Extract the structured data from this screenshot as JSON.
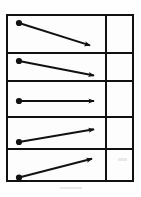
{
  "figure": {
    "background_color": "#ffffff",
    "ink_color": "#111111",
    "frame": {
      "x": 6,
      "y": 14,
      "width": 128,
      "height": 168,
      "border_width": 2
    },
    "columns": [
      {
        "name": "vector-column",
        "x": 0,
        "width": 97,
        "label": ""
      },
      {
        "name": "answer-column",
        "x": 99,
        "width": 27,
        "label": ""
      }
    ],
    "column_divider_x": 97,
    "row_divider_ys": [
      36,
      64,
      100,
      132
    ],
    "rows": [
      {
        "index": 1,
        "name": "row-1",
        "vector": {
          "name": "arrow-down-steep",
          "direction": "down-right",
          "start": {
            "x": 11,
            "y": 7
          },
          "end": {
            "x": 84,
            "y": 30
          },
          "dx": 73,
          "dy": 23,
          "slope_description": "steeply descending",
          "has_start_dot": true,
          "has_arrowhead": true
        },
        "answer_cell": ""
      },
      {
        "index": 2,
        "name": "row-2",
        "vector": {
          "name": "arrow-down-shallow",
          "direction": "down-right",
          "start": {
            "x": 11,
            "y": 7
          },
          "end": {
            "x": 88,
            "y": 22
          },
          "dx": 77,
          "dy": 15,
          "slope_description": "gently descending",
          "has_start_dot": true,
          "has_arrowhead": true
        },
        "answer_cell": ""
      },
      {
        "index": 3,
        "name": "row-3",
        "vector": {
          "name": "arrow-horizontal",
          "direction": "right",
          "start": {
            "x": 11,
            "y": 18
          },
          "end": {
            "x": 88,
            "y": 18
          },
          "dx": 77,
          "dy": 0,
          "slope_description": "horizontal",
          "has_start_dot": true,
          "has_arrowhead": true
        },
        "answer_cell": ""
      },
      {
        "index": 4,
        "name": "row-4",
        "vector": {
          "name": "arrow-up-shallow",
          "direction": "up-right",
          "start": {
            "x": 11,
            "y": 24
          },
          "end": {
            "x": 88,
            "y": 11
          },
          "dx": 77,
          "dy": -13,
          "slope_description": "gently ascending",
          "has_start_dot": true,
          "has_arrowhead": true
        },
        "answer_cell": ""
      },
      {
        "index": 5,
        "name": "row-5",
        "vector": {
          "name": "arrow-up-steep",
          "direction": "up-right",
          "start": {
            "x": 11,
            "y": 28
          },
          "end": {
            "x": 86,
            "y": 8
          },
          "dx": 75,
          "dy": -20,
          "slope_description": "steeply ascending",
          "has_start_dot": true,
          "has_arrowhead": true
        },
        "answer_cell": ""
      }
    ]
  }
}
